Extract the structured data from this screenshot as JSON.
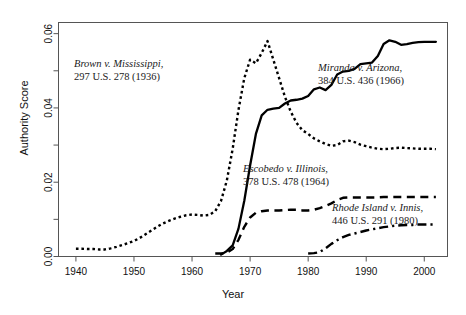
{
  "chart_data": {
    "type": "line",
    "title": "",
    "xlabel": "Year",
    "ylabel": "Authority Score",
    "xlim": [
      1937,
      2004
    ],
    "ylim": [
      0.0,
      0.063
    ],
    "grid": false,
    "legend": "annotations-inline",
    "xticks": [
      1940,
      1950,
      1960,
      1970,
      1980,
      1990,
      2000
    ],
    "xticklabels": [
      "1940",
      "1950",
      "1960",
      "1970",
      "1980",
      "1990",
      "2000"
    ],
    "yticks": [
      0.0,
      0.01,
      0.02,
      0.03,
      0.04,
      0.05,
      0.06
    ],
    "yticklabels": [
      "0.00",
      "",
      "0.02",
      "",
      "0.04",
      "",
      "0.06"
    ],
    "series": [
      {
        "name": "Brown v. Mississippi",
        "style": "dotted",
        "color": "#000000",
        "x": [
          1940,
          1941,
          1942,
          1943,
          1944,
          1945,
          1946,
          1947,
          1948,
          1949,
          1950,
          1951,
          1952,
          1953,
          1954,
          1955,
          1956,
          1957,
          1958,
          1959,
          1960,
          1961,
          1962,
          1963,
          1964,
          1965,
          1966,
          1967,
          1968,
          1969,
          1970,
          1971,
          1972,
          1973,
          1974,
          1975,
          1976,
          1977,
          1978,
          1979,
          1980,
          1981,
          1982,
          1983,
          1984,
          1985,
          1986,
          1987,
          1988,
          1989,
          1990,
          1991,
          1992,
          1993,
          1994,
          1995,
          1996,
          1997,
          1998,
          1999,
          2000,
          2001,
          2002
        ],
        "y": [
          0.0021,
          0.0021,
          0.002,
          0.002,
          0.0019,
          0.0019,
          0.0022,
          0.0026,
          0.0031,
          0.0036,
          0.0042,
          0.005,
          0.006,
          0.007,
          0.008,
          0.0089,
          0.0096,
          0.0102,
          0.0107,
          0.0111,
          0.0113,
          0.0112,
          0.011,
          0.0112,
          0.0122,
          0.015,
          0.0205,
          0.029,
          0.0395,
          0.048,
          0.053,
          0.052,
          0.0548,
          0.058,
          0.053,
          0.048,
          0.043,
          0.039,
          0.036,
          0.034,
          0.033,
          0.0318,
          0.031,
          0.0303,
          0.0298,
          0.03,
          0.031,
          0.0312,
          0.0308,
          0.0301,
          0.0297,
          0.0293,
          0.029,
          0.0289,
          0.029,
          0.0292,
          0.0293,
          0.0292,
          0.0291,
          0.029,
          0.029,
          0.029,
          0.0289
        ]
      },
      {
        "name": "Miranda v. Arizona",
        "style": "solid",
        "color": "#000000",
        "x": [
          1965,
          1966,
          1967,
          1968,
          1969,
          1970,
          1971,
          1972,
          1973,
          1974,
          1975,
          1976,
          1977,
          1978,
          1979,
          1980,
          1981,
          1982,
          1983,
          1984,
          1985,
          1986,
          1987,
          1988,
          1989,
          1990,
          1991,
          1992,
          1993,
          1994,
          1995,
          1996,
          1997,
          1998,
          1999,
          2000,
          2001,
          2002
        ],
        "y": [
          0.0005,
          0.0015,
          0.003,
          0.0075,
          0.015,
          0.0245,
          0.033,
          0.038,
          0.0395,
          0.0398,
          0.04,
          0.0412,
          0.042,
          0.0422,
          0.0425,
          0.0432,
          0.045,
          0.0455,
          0.0448,
          0.0462,
          0.049,
          0.0498,
          0.05,
          0.0505,
          0.0518,
          0.052,
          0.0522,
          0.054,
          0.0572,
          0.0582,
          0.0578,
          0.057,
          0.0572,
          0.0575,
          0.0577,
          0.0578,
          0.0578,
          0.0578
        ]
      },
      {
        "name": "Escobedo v. Illinois",
        "style": "dashed",
        "color": "#000000",
        "x": [
          1964,
          1965,
          1966,
          1967,
          1968,
          1969,
          1970,
          1971,
          1972,
          1973,
          1974,
          1975,
          1976,
          1977,
          1978,
          1979,
          1980,
          1981,
          1982,
          1983,
          1984,
          1985,
          1986,
          1987,
          1988,
          1989,
          1990,
          1991,
          1992,
          1993,
          1994,
          1995,
          1996,
          1997,
          1998,
          1999,
          2000,
          2001,
          2002
        ],
        "y": [
          0.0008,
          0.0008,
          0.001,
          0.002,
          0.0045,
          0.008,
          0.0105,
          0.0118,
          0.0122,
          0.0124,
          0.0124,
          0.0124,
          0.0125,
          0.0126,
          0.0126,
          0.0124,
          0.0124,
          0.0126,
          0.013,
          0.0136,
          0.0143,
          0.0152,
          0.0158,
          0.0159,
          0.0159,
          0.0159,
          0.0159,
          0.0159,
          0.0159,
          0.016,
          0.016,
          0.016,
          0.016,
          0.016,
          0.016,
          0.016,
          0.016,
          0.016,
          0.016
        ]
      },
      {
        "name": "Rhode Island v. Innis",
        "style": "dashdot",
        "color": "#000000",
        "x": [
          1980,
          1981,
          1982,
          1983,
          1984,
          1985,
          1986,
          1987,
          1988,
          1989,
          1990,
          1991,
          1992,
          1993,
          1994,
          1995,
          1996,
          1997,
          1998,
          1999,
          2000,
          2001,
          2002
        ],
        "y": [
          0.0008,
          0.0009,
          0.0012,
          0.0022,
          0.0034,
          0.0044,
          0.0052,
          0.0058,
          0.0062,
          0.0066,
          0.007,
          0.0073,
          0.0076,
          0.0079,
          0.0081,
          0.0083,
          0.0084,
          0.0085,
          0.0085,
          0.0086,
          0.0086,
          0.0086,
          0.0086
        ]
      }
    ],
    "annotations": [
      {
        "id": "brown",
        "case": "Brown v. Mississippi,",
        "citation": "297 U.S. 278 (1936)"
      },
      {
        "id": "miranda",
        "case": "Miranda v. Arizona,",
        "citation": "384 U.S. 436 (1966)"
      },
      {
        "id": "escobedo",
        "case": "Escobedo v. Illinois,",
        "citation": "378 U.S. 478 (1964)"
      },
      {
        "id": "rhode",
        "case": "Rhode Island v. Innis,",
        "citation": "446 U.S. 291 (1980)"
      }
    ]
  }
}
